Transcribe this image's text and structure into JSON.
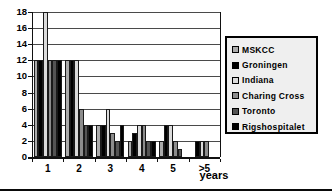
{
  "chart_data": {
    "type": "bar",
    "title": "",
    "xlabel": "years",
    "ylabel": "",
    "ylim": [
      0,
      18
    ],
    "yticks": [
      0,
      2,
      4,
      6,
      8,
      10,
      12,
      14,
      16,
      18
    ],
    "grid": true,
    "legend_position": "right",
    "categories": [
      "1",
      "2",
      "3",
      "4",
      "5",
      ">5"
    ],
    "series": [
      {
        "name": "MSKCC",
        "color": "#ababab",
        "values": [
          12,
          12,
          4,
          2,
          2,
          0
        ]
      },
      {
        "name": "Groningen",
        "color": "#000000",
        "values": [
          12,
          12,
          4,
          3,
          4,
          2
        ]
      },
      {
        "name": "Indiana",
        "color": "#dbdbdb",
        "values": [
          18,
          12,
          6,
          4,
          4,
          2
        ]
      },
      {
        "name": "Charing Cross",
        "color": "#8c8c8c",
        "values": [
          12,
          6,
          3,
          4,
          2,
          2
        ]
      },
      {
        "name": "Toronto",
        "color": "#545454",
        "values": [
          12,
          4,
          2,
          2,
          1,
          0
        ]
      },
      {
        "name": "Rigshospitalet",
        "color": "#000000",
        "values": [
          12,
          4,
          4,
          2,
          0,
          0
        ]
      }
    ]
  },
  "colors": {
    "gridline": "#4a4a4a",
    "axis": "#111111",
    "bar_outline": "#1a1a1a",
    "legend_bg": "#efefef",
    "legend_border": "#000000",
    "background": "#ffffff"
  }
}
